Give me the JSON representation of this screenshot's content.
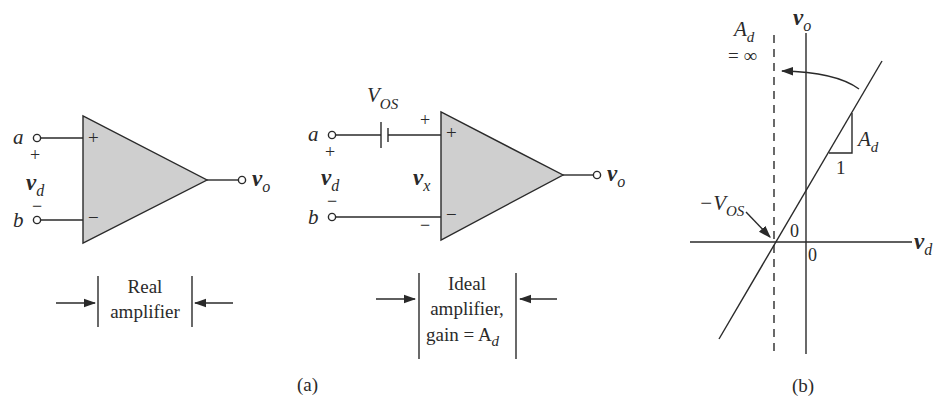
{
  "figure_a": {
    "caption": "(a)",
    "real_amp": {
      "node_a": "a",
      "node_b": "b",
      "plus_in": "+",
      "minus_in": "−",
      "vd_plus": "+",
      "vd_minus": "−",
      "vd": "v",
      "vd_sub": "d",
      "vo": "v",
      "vo_sub": "o",
      "label_line1": "Real",
      "label_line2": "amplifier"
    },
    "ideal_amp": {
      "node_a": "a",
      "node_b": "b",
      "plus_in": "+",
      "minus_in": "−",
      "vd_plus": "+",
      "vd_minus": "−",
      "vd": "v",
      "vd_sub": "d",
      "vx": "v",
      "vx_sub": "x",
      "vx_plus": "+",
      "vx_minus": "−",
      "vos": "V",
      "vos_sub": "OS",
      "vo": "v",
      "vo_sub": "o",
      "label_line1": "Ideal",
      "label_line2": "amplifier,",
      "label_line3": "gain = A",
      "label_line3_sub": "d"
    }
  },
  "figure_b": {
    "caption": "(b)",
    "y_axis": "v",
    "y_axis_sub": "o",
    "x_axis": "v",
    "x_axis_sub": "d",
    "ad_inf_line1": "A",
    "ad_inf_line1_sub": "d",
    "ad_inf_line2": "= ∞",
    "slope_rise": "A",
    "slope_rise_sub": "d",
    "slope_run": "1",
    "neg_vos": "−V",
    "neg_vos_sub": "OS",
    "origin_x": "0",
    "origin_y": "0"
  }
}
